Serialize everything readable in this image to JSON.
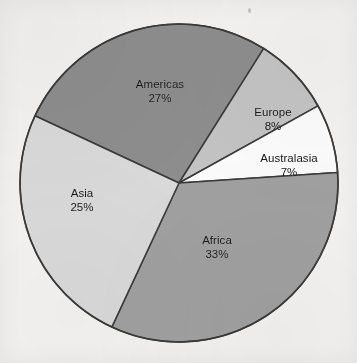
{
  "figure": {
    "background_color": "#f3f2f0",
    "outline_color": "#3a3a3a"
  },
  "chart_data": {
    "type": "pie",
    "title": "",
    "subtitle": "",
    "xlabel": "",
    "ylabel": "",
    "legend_position": "none",
    "grid": false,
    "labels_inside_slices": true,
    "units": "percent",
    "total": 100,
    "categories": [
      "Americas",
      "Europe",
      "Australasia",
      "Africa",
      "Asia"
    ],
    "values": [
      27,
      8,
      7,
      33,
      25
    ],
    "value_labels": [
      "27%",
      "8%",
      "7%",
      "33%",
      "25%"
    ],
    "colors": [
      "#8d8d8d",
      "#c3c3c3",
      "#fbfbfb",
      "#a0a0a0",
      "#d9d9d9"
    ],
    "start_angle_deg": -65,
    "direction": "clockwise",
    "slices": [
      {
        "name": "Americas",
        "value": 27,
        "value_label": "27%",
        "color": "#8d8d8d",
        "start_deg": -65.0,
        "end_deg": 32.2
      },
      {
        "name": "Europe",
        "value": 8,
        "value_label": "8%",
        "color": "#c3c3c3",
        "start_deg": 32.2,
        "end_deg": 61.0
      },
      {
        "name": "Australasia",
        "value": 7,
        "value_label": "7%",
        "color": "#fbfbfb",
        "start_deg": 61.0,
        "end_deg": 86.2
      },
      {
        "name": "Africa",
        "value": 33,
        "value_label": "33%",
        "color": "#a0a0a0",
        "start_deg": 86.2,
        "end_deg": 205.0
      },
      {
        "name": "Asia",
        "value": 25,
        "value_label": "25%",
        "color": "#d9d9d9",
        "start_deg": 205.0,
        "end_deg": 295.0
      }
    ]
  },
  "labels": {
    "americas": {
      "name": "Americas",
      "value": "27%"
    },
    "europe": {
      "name": "Europe",
      "value": "8%"
    },
    "australasia": {
      "name": "Australasia",
      "value": "7%"
    },
    "africa": {
      "name": "Africa",
      "value": "33%"
    },
    "asia": {
      "name": "Asia",
      "value": "25%"
    }
  }
}
